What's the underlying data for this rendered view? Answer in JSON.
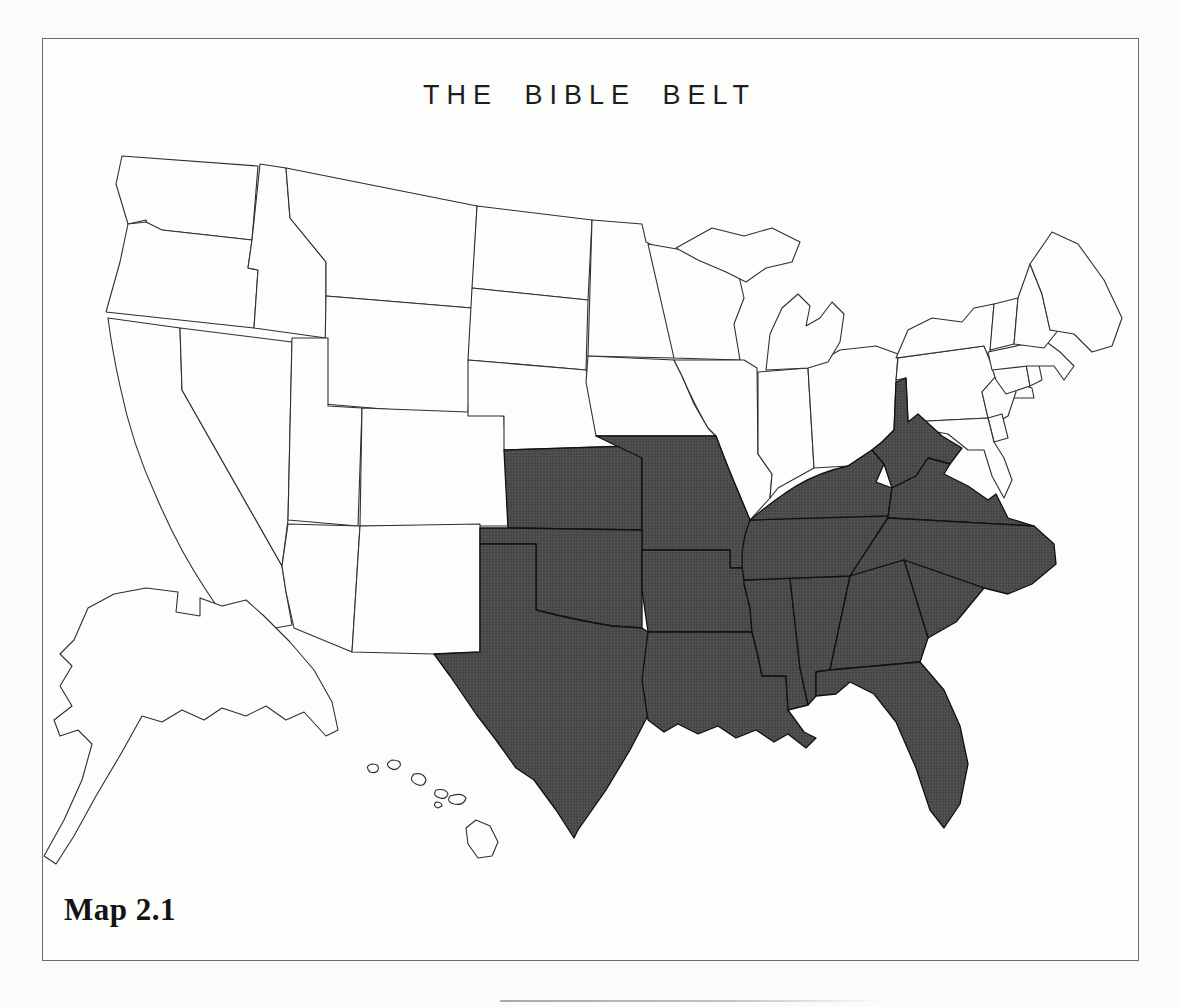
{
  "figure": {
    "title": "THE BIBLE BELT",
    "caption": "Map 2.1"
  },
  "map": {
    "region": "United States",
    "highlight_color": "#4a4a4a",
    "base_fill": "#fdfdfc",
    "border_color": "#2e2e2e",
    "highlighted_group": "Bible Belt states (shaded)",
    "states": [
      {
        "id": "WA",
        "name": "Washington",
        "highlighted": false
      },
      {
        "id": "OR",
        "name": "Oregon",
        "highlighted": false
      },
      {
        "id": "CA",
        "name": "California",
        "highlighted": false
      },
      {
        "id": "NV",
        "name": "Nevada",
        "highlighted": false
      },
      {
        "id": "ID",
        "name": "Idaho",
        "highlighted": false
      },
      {
        "id": "MT",
        "name": "Montana",
        "highlighted": false
      },
      {
        "id": "WY",
        "name": "Wyoming",
        "highlighted": false
      },
      {
        "id": "UT",
        "name": "Utah",
        "highlighted": false
      },
      {
        "id": "CO",
        "name": "Colorado",
        "highlighted": false
      },
      {
        "id": "AZ",
        "name": "Arizona",
        "highlighted": false
      },
      {
        "id": "NM",
        "name": "New Mexico",
        "highlighted": false
      },
      {
        "id": "ND",
        "name": "North Dakota",
        "highlighted": false
      },
      {
        "id": "SD",
        "name": "South Dakota",
        "highlighted": false
      },
      {
        "id": "NE",
        "name": "Nebraska",
        "highlighted": false
      },
      {
        "id": "MN",
        "name": "Minnesota",
        "highlighted": false
      },
      {
        "id": "IA",
        "name": "Iowa",
        "highlighted": false
      },
      {
        "id": "WI",
        "name": "Wisconsin",
        "highlighted": false
      },
      {
        "id": "IL",
        "name": "Illinois",
        "highlighted": false
      },
      {
        "id": "IN",
        "name": "Indiana",
        "highlighted": false
      },
      {
        "id": "OH",
        "name": "Ohio",
        "highlighted": false
      },
      {
        "id": "MI",
        "name": "Michigan",
        "highlighted": false
      },
      {
        "id": "PA",
        "name": "Pennsylvania",
        "highlighted": false
      },
      {
        "id": "NY",
        "name": "New York",
        "highlighted": false
      },
      {
        "id": "NJ",
        "name": "New Jersey",
        "highlighted": false
      },
      {
        "id": "DE",
        "name": "Delaware",
        "highlighted": false
      },
      {
        "id": "MD",
        "name": "Maryland",
        "highlighted": false
      },
      {
        "id": "CT",
        "name": "Connecticut",
        "highlighted": false
      },
      {
        "id": "RI",
        "name": "Rhode Island",
        "highlighted": false
      },
      {
        "id": "MA",
        "name": "Massachusetts",
        "highlighted": false
      },
      {
        "id": "VT",
        "name": "Vermont",
        "highlighted": false
      },
      {
        "id": "NH",
        "name": "New Hampshire",
        "highlighted": false
      },
      {
        "id": "ME",
        "name": "Maine",
        "highlighted": false
      },
      {
        "id": "AK",
        "name": "Alaska",
        "highlighted": false
      },
      {
        "id": "HI",
        "name": "Hawaii",
        "highlighted": false
      },
      {
        "id": "KS",
        "name": "Kansas",
        "highlighted": true
      },
      {
        "id": "MO",
        "name": "Missouri",
        "highlighted": true
      },
      {
        "id": "OK",
        "name": "Oklahoma",
        "highlighted": true
      },
      {
        "id": "TX",
        "name": "Texas",
        "highlighted": true
      },
      {
        "id": "AR",
        "name": "Arkansas",
        "highlighted": true
      },
      {
        "id": "LA",
        "name": "Louisiana",
        "highlighted": true
      },
      {
        "id": "MS",
        "name": "Mississippi",
        "highlighted": true
      },
      {
        "id": "AL",
        "name": "Alabama",
        "highlighted": true
      },
      {
        "id": "TN",
        "name": "Tennessee",
        "highlighted": true
      },
      {
        "id": "KY",
        "name": "Kentucky",
        "highlighted": true
      },
      {
        "id": "WV",
        "name": "West Virginia",
        "highlighted": true
      },
      {
        "id": "VA",
        "name": "Virginia",
        "highlighted": true
      },
      {
        "id": "NC",
        "name": "North Carolina",
        "highlighted": true
      },
      {
        "id": "SC",
        "name": "South Carolina",
        "highlighted": true
      },
      {
        "id": "GA",
        "name": "Georgia",
        "highlighted": true
      },
      {
        "id": "FL",
        "name": "Florida",
        "highlighted": true
      }
    ]
  }
}
